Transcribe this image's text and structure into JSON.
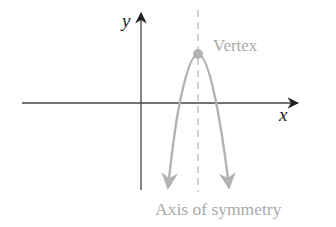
{
  "diagram": {
    "axes": {
      "x_label": "x",
      "y_label": "y"
    },
    "labels": {
      "vertex": "Vertex",
      "axis_of_symmetry": "Axis of symmetry"
    },
    "colors": {
      "axes": "#333333",
      "curve": "#b3b3b3",
      "label": "#aaaaaa",
      "vertex_dot": "#b3b3b3"
    }
  }
}
